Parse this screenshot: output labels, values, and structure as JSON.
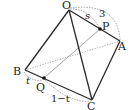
{
  "diagram": {
    "type": "tetrahedron",
    "colors": {
      "edge": "#2a2a2a",
      "hidden": "#9a9a9a",
      "arc": "#8a8a8a",
      "point": "#111111"
    },
    "vertices": {
      "O": {
        "label": "O",
        "x": 69,
        "y": 10
      },
      "A": {
        "label": "A",
        "x": 120,
        "y": 41
      },
      "B": {
        "label": "B",
        "x": 25,
        "y": 70
      },
      "C": {
        "label": "C",
        "x": 92,
        "y": 100
      }
    },
    "points": {
      "P": {
        "label": "P",
        "on": "OA",
        "x": 100,
        "y": 29
      },
      "Q": {
        "label": "Q",
        "on": "BC",
        "x": 44,
        "y": 78
      }
    },
    "annotations": {
      "OP": "s",
      "OA": "3",
      "BQ": "t",
      "QC": "1−t"
    }
  }
}
